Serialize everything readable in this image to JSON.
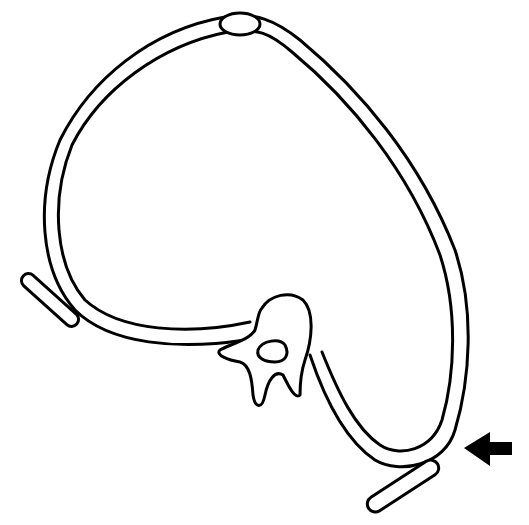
{
  "diagram": {
    "type": "line-drawing",
    "colors": {
      "line": "#000000",
      "background": "#ffffff",
      "arrow": "#000000"
    },
    "elements": [
      {
        "id": "ring-band",
        "description": "closed double-line band forming a loop"
      },
      {
        "id": "top-clasp",
        "description": "oval joint at top of band"
      },
      {
        "id": "vertebra",
        "description": "vertebra cross-section with central canal"
      },
      {
        "id": "left-pad",
        "description": "elongated pad on left"
      },
      {
        "id": "right-pad",
        "description": "elongated pad on lower right"
      },
      {
        "id": "pointer-arrow",
        "description": "solid black arrow pointing left toward right pad"
      }
    ]
  }
}
